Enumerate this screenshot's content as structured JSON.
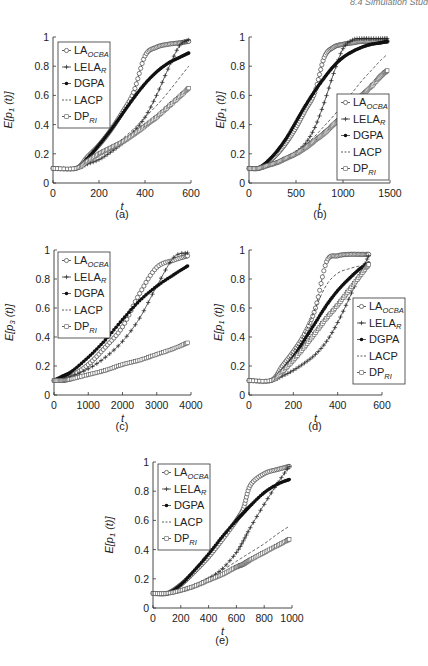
{
  "header": {
    "running_title": "8.4 Simulation Stud"
  },
  "legend_labels": [
    {
      "main": "LA",
      "sub": "OCBA",
      "marker": "open-circle",
      "line": "dash"
    },
    {
      "main": "LELA",
      "sub": "R",
      "marker": "plus",
      "line": "solid"
    },
    {
      "main": "DGPA",
      "sub": "",
      "marker": "filled-circle",
      "line": "solid"
    },
    {
      "main": "LACP",
      "sub": "",
      "marker": "none",
      "line": "dash"
    },
    {
      "main": "DP",
      "sub": "RI",
      "marker": "open-square",
      "line": "dash"
    }
  ],
  "chart_data": [
    {
      "id": "a",
      "caption": "(a)",
      "type": "line",
      "xlabel": "t",
      "ylabel": "E[p1(t)]",
      "ylabel_sub": "1",
      "xlim": [
        0,
        600
      ],
      "ylim": [
        0,
        1
      ],
      "xticks": [
        0,
        200,
        400,
        600
      ],
      "yticks": [
        0,
        0.2,
        0.4,
        0.6,
        0.8,
        1
      ],
      "legend_position": "upper-left",
      "grid": false,
      "x": [
        0,
        100,
        150,
        200,
        250,
        300,
        350,
        400,
        450,
        500,
        550,
        590
      ],
      "series": [
        {
          "name": "LA_OCBA",
          "values": [
            0.1,
            0.1,
            0.18,
            0.26,
            0.36,
            0.48,
            0.62,
            0.87,
            0.93,
            0.95,
            0.96,
            0.97
          ]
        },
        {
          "name": "LELA_R",
          "values": [
            0.1,
            0.1,
            0.13,
            0.16,
            0.21,
            0.27,
            0.35,
            0.45,
            0.6,
            0.78,
            0.94,
            0.98
          ]
        },
        {
          "name": "DGPA",
          "values": [
            0.1,
            0.1,
            0.17,
            0.26,
            0.36,
            0.47,
            0.58,
            0.68,
            0.76,
            0.82,
            0.86,
            0.89
          ]
        },
        {
          "name": "LACP",
          "values": [
            0.1,
            0.1,
            0.14,
            0.19,
            0.24,
            0.3,
            0.37,
            0.45,
            0.53,
            0.62,
            0.72,
            0.8
          ]
        },
        {
          "name": "DP_RI",
          "values": [
            0.1,
            0.1,
            0.15,
            0.2,
            0.24,
            0.28,
            0.33,
            0.39,
            0.45,
            0.52,
            0.59,
            0.65
          ]
        }
      ]
    },
    {
      "id": "b",
      "caption": "(b)",
      "type": "line",
      "xlabel": "t",
      "ylabel": "E[p1(t)]",
      "ylabel_sub": "1",
      "xlim": [
        0,
        1500
      ],
      "ylim": [
        0,
        1
      ],
      "xticks": [
        0,
        500,
        1000,
        1500
      ],
      "yticks": [
        0,
        0.2,
        0.4,
        0.6,
        0.8,
        1
      ],
      "legend_position": "lower-right",
      "grid": false,
      "x": [
        0,
        100,
        200,
        300,
        400,
        500,
        600,
        700,
        800,
        900,
        1000,
        1100,
        1200,
        1300,
        1400,
        1470
      ],
      "series": [
        {
          "name": "LA_OCBA",
          "values": [
            0.1,
            0.1,
            0.14,
            0.2,
            0.28,
            0.38,
            0.5,
            0.62,
            0.86,
            0.93,
            0.95,
            0.96,
            0.97,
            0.97,
            0.97,
            0.97
          ]
        },
        {
          "name": "LELA_R",
          "values": [
            0.1,
            0.1,
            0.12,
            0.14,
            0.17,
            0.21,
            0.27,
            0.38,
            0.55,
            0.75,
            0.92,
            0.98,
            0.99,
            0.99,
            0.99,
            0.99
          ]
        },
        {
          "name": "DGPA",
          "values": [
            0.1,
            0.1,
            0.15,
            0.22,
            0.31,
            0.42,
            0.53,
            0.63,
            0.72,
            0.8,
            0.86,
            0.9,
            0.93,
            0.95,
            0.96,
            0.97
          ]
        },
        {
          "name": "LACP",
          "values": [
            0.1,
            0.1,
            0.12,
            0.14,
            0.17,
            0.21,
            0.26,
            0.32,
            0.39,
            0.46,
            0.54,
            0.62,
            0.7,
            0.77,
            0.84,
            0.88
          ]
        },
        {
          "name": "DP_RI",
          "values": [
            0.1,
            0.1,
            0.12,
            0.14,
            0.17,
            0.2,
            0.24,
            0.29,
            0.34,
            0.4,
            0.46,
            0.53,
            0.6,
            0.66,
            0.73,
            0.77
          ]
        }
      ]
    },
    {
      "id": "c",
      "caption": "(c)",
      "type": "line",
      "xlabel": "t",
      "ylabel": "E[p3(t)]",
      "ylabel_sub": "3",
      "xlim": [
        0,
        4000
      ],
      "ylim": [
        0,
        1
      ],
      "xticks": [
        0,
        1000,
        2000,
        3000,
        4000
      ],
      "yticks": [
        0,
        0.2,
        0.4,
        0.6,
        0.8,
        1
      ],
      "legend_position": "upper-left",
      "grid": false,
      "x": [
        0,
        250,
        500,
        1000,
        1500,
        2000,
        2500,
        3000,
        3500,
        3900
      ],
      "series": [
        {
          "name": "LA_OCBA",
          "values": [
            0.1,
            0.11,
            0.13,
            0.21,
            0.33,
            0.47,
            0.7,
            0.88,
            0.93,
            0.96
          ]
        },
        {
          "name": "LELA_R",
          "values": [
            0.1,
            0.11,
            0.13,
            0.18,
            0.26,
            0.37,
            0.53,
            0.75,
            0.95,
            0.98
          ]
        },
        {
          "name": "DGPA",
          "values": [
            0.1,
            0.13,
            0.16,
            0.26,
            0.38,
            0.52,
            0.65,
            0.75,
            0.83,
            0.89
          ]
        },
        {
          "name": "LACP",
          "values": [
            0.1,
            0.1,
            0.11,
            0.14,
            0.17,
            0.21,
            0.25,
            0.29,
            0.33,
            0.37
          ]
        },
        {
          "name": "DP_RI",
          "values": [
            0.1,
            0.1,
            0.11,
            0.14,
            0.17,
            0.21,
            0.24,
            0.28,
            0.32,
            0.36
          ]
        }
      ]
    },
    {
      "id": "d",
      "caption": "(d)",
      "type": "line",
      "xlabel": "t",
      "ylabel": "E[p1(t)]",
      "ylabel_sub": "1",
      "xlim": [
        0,
        600
      ],
      "ylim": [
        0,
        1
      ],
      "xticks": [
        0,
        200,
        400,
        600
      ],
      "yticks": [
        0,
        0.2,
        0.4,
        0.6,
        0.8,
        1
      ],
      "legend_position": "lower-right",
      "grid": false,
      "x": [
        0,
        100,
        150,
        200,
        250,
        300,
        350,
        400,
        450,
        500,
        540
      ],
      "series": [
        {
          "name": "LA_OCBA",
          "values": [
            0.1,
            0.1,
            0.2,
            0.3,
            0.42,
            0.6,
            0.92,
            0.96,
            0.97,
            0.97,
            0.97
          ]
        },
        {
          "name": "LELA_R",
          "values": [
            0.1,
            0.1,
            0.13,
            0.17,
            0.22,
            0.28,
            0.37,
            0.5,
            0.66,
            0.83,
            0.96
          ]
        },
        {
          "name": "DGPA",
          "values": [
            0.1,
            0.1,
            0.17,
            0.26,
            0.38,
            0.5,
            0.62,
            0.72,
            0.8,
            0.87,
            0.91
          ]
        },
        {
          "name": "LACP",
          "values": [
            0.1,
            0.1,
            0.18,
            0.3,
            0.42,
            0.6,
            0.76,
            0.84,
            0.87,
            0.89,
            0.9
          ]
        },
        {
          "name": "DP_RI",
          "values": [
            0.1,
            0.1,
            0.16,
            0.24,
            0.33,
            0.43,
            0.53,
            0.62,
            0.72,
            0.82,
            0.9
          ]
        }
      ]
    },
    {
      "id": "e",
      "caption": "(e)",
      "type": "line",
      "xlabel": "t",
      "ylabel": "E[p1(t)]",
      "ylabel_sub": "1",
      "xlim": [
        0,
        1000
      ],
      "ylim": [
        0,
        1
      ],
      "xticks": [
        0,
        200,
        400,
        600,
        800,
        1000
      ],
      "yticks": [
        0,
        0.2,
        0.4,
        0.6,
        0.8,
        1
      ],
      "legend_position": "upper-left",
      "grid": false,
      "x": [
        0,
        100,
        200,
        300,
        400,
        500,
        600,
        650,
        700,
        800,
        900,
        980
      ],
      "series": [
        {
          "name": "LA_OCBA",
          "values": [
            0.1,
            0.1,
            0.16,
            0.25,
            0.35,
            0.47,
            0.6,
            0.68,
            0.84,
            0.92,
            0.95,
            0.97
          ]
        },
        {
          "name": "LELA_R",
          "values": [
            0.1,
            0.1,
            0.12,
            0.15,
            0.2,
            0.27,
            0.38,
            0.46,
            0.55,
            0.71,
            0.86,
            0.97
          ]
        },
        {
          "name": "DGPA",
          "values": [
            0.1,
            0.1,
            0.16,
            0.26,
            0.37,
            0.49,
            0.6,
            0.65,
            0.7,
            0.79,
            0.85,
            0.88
          ]
        },
        {
          "name": "LACP",
          "values": [
            0.1,
            0.1,
            0.12,
            0.16,
            0.21,
            0.26,
            0.32,
            0.35,
            0.38,
            0.44,
            0.51,
            0.56
          ]
        },
        {
          "name": "DP_RI",
          "values": [
            0.1,
            0.1,
            0.12,
            0.15,
            0.19,
            0.23,
            0.28,
            0.3,
            0.33,
            0.38,
            0.43,
            0.47
          ]
        }
      ]
    }
  ]
}
